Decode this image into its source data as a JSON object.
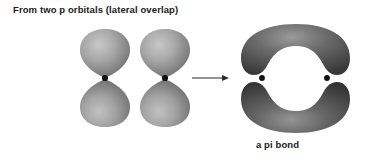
{
  "figure": {
    "title": "From two p orbitals (lateral overlap)",
    "caption": "a pi bond",
    "background_color": "#ffffff",
    "text_color": "#1a1a1a"
  },
  "diagram": {
    "type": "orbital-overlap-diagram",
    "orbital_fill_light": "#b6b6b6",
    "orbital_fill_dark": "#6e6e6e",
    "pi_lobe_fill_light": "#8a8a8a",
    "pi_lobe_fill_dark": "#3d3d3d",
    "nucleus_color": "#111111",
    "arrow_color": "#2b2b2b",
    "reactants": [
      {
        "label": "p-orbital-left",
        "nucleus_x": 105,
        "nucleus_y": 78,
        "lobes": 2
      },
      {
        "label": "p-orbital-right",
        "nucleus_x": 165,
        "nucleus_y": 78,
        "lobes": 2
      }
    ],
    "arrow": {
      "label": "reaction-arrow",
      "x_start": 192,
      "x_end": 229,
      "y": 78
    },
    "product": {
      "label": "pi-bond",
      "lobes": 2,
      "nuclei": [
        {
          "x": 262,
          "y": 78
        },
        {
          "x": 327,
          "y": 78
        }
      ]
    }
  }
}
